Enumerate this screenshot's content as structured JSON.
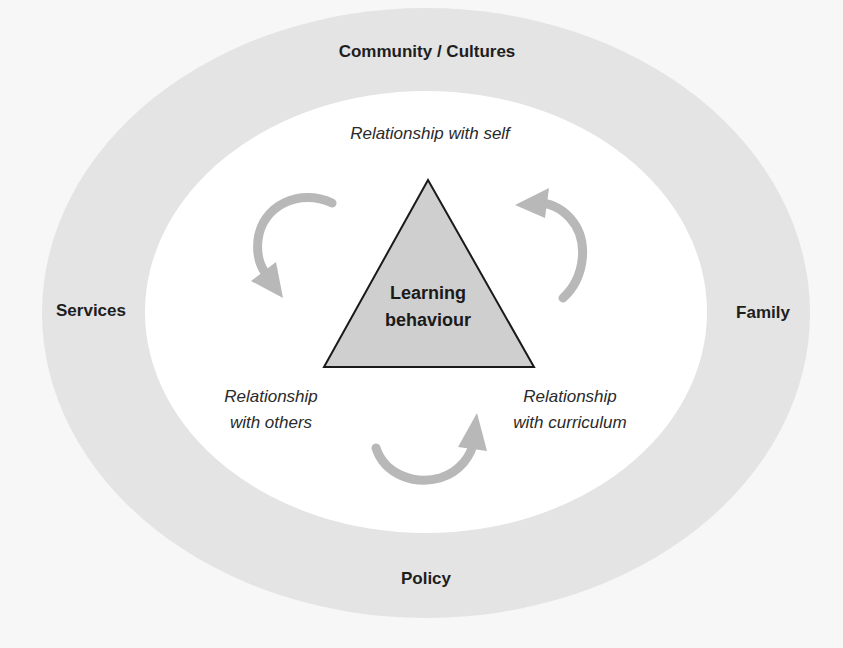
{
  "diagram": {
    "center": {
      "line1": "Learning",
      "line2": "behaviour"
    },
    "inner_relationships": {
      "self": "Relationship with self",
      "others": {
        "line1": "Relationship",
        "line2": "with others"
      },
      "curriculum": {
        "line1": "Relationship",
        "line2": "with curriculum"
      }
    },
    "outer_ring": {
      "top": "Community / Cultures",
      "left": "Services",
      "right": "Family",
      "bottom": "Policy"
    },
    "colors": {
      "background": "#f7f7f7",
      "ring": "#e4e4e4",
      "inner": "#ffffff",
      "triangle_fill": "#cfcfcf",
      "triangle_stroke": "#1a1a1a",
      "arrows": "#b8b8b8",
      "text": "#1e1e1e"
    },
    "arrows": [
      {
        "from": "self",
        "to": "others",
        "direction": "counter-clockwise"
      },
      {
        "from": "others",
        "to": "curriculum",
        "direction": "counter-clockwise"
      },
      {
        "from": "curriculum",
        "to": "self",
        "direction": "counter-clockwise"
      }
    ]
  }
}
